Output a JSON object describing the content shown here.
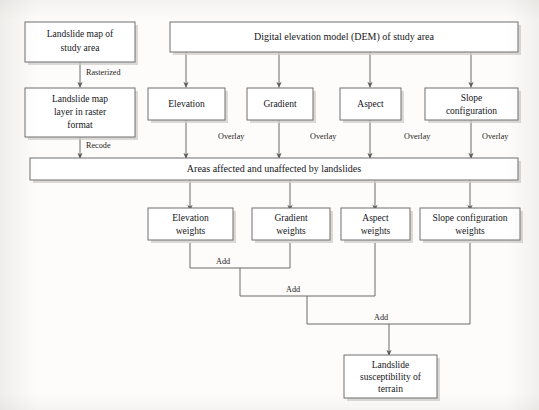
{
  "diagram": {
    "type": "flowchart",
    "canvas": {
      "width": 539,
      "height": 410
    },
    "colors": {
      "background": "#fdfcfa",
      "box_fill": "#ffffff",
      "box_border": "#6f6f70",
      "line": "#6a6a6b",
      "text": "#16161a",
      "shadow": "#cfcdc9"
    },
    "nodes": {
      "landslide_map": {
        "line1": "Landslide map of",
        "line2": "study area"
      },
      "dem": {
        "line1": "Digital elevation model (DEM) of study area"
      },
      "landslide_raster": {
        "line1": "Landslide map",
        "line2": "layer in raster",
        "line3": "format"
      },
      "elevation": {
        "line1": "Elevation"
      },
      "gradient": {
        "line1": "Gradient"
      },
      "aspect": {
        "line1": "Aspect"
      },
      "slope_configuration": {
        "line1": "Slope",
        "line2": "configuration"
      },
      "areas_affected": {
        "line1": "Areas affected and unaffected by landslides"
      },
      "elevation_weights": {
        "line1": "Elevation",
        "line2": "weights"
      },
      "gradient_weights": {
        "line1": "Gradient",
        "line2": "weights"
      },
      "aspect_weights": {
        "line1": "Aspect",
        "line2": "weights"
      },
      "slope_configuration_weights": {
        "line1": "Slope configuration",
        "line2": "weights"
      },
      "susceptibility": {
        "line1": "Landslide",
        "line2": "susceptibility of",
        "line3": "terrain"
      }
    },
    "edge_labels": {
      "rasterized": "Rasterized",
      "recode": "Recode",
      "overlay_elevation": "Overlay",
      "overlay_gradient": "Overlay",
      "overlay_aspect": "Overlay",
      "overlay_slope": "Overlay",
      "add_1": "Add",
      "add_2": "Add",
      "add_3": "Add"
    }
  }
}
